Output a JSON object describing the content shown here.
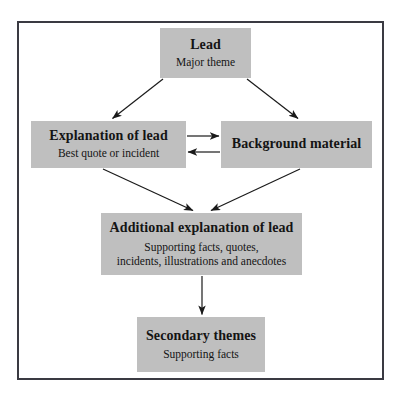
{
  "diagram": {
    "frame_color": "#3a3a42",
    "node_fill": "#bfbfbf",
    "text_color": "#141414",
    "arrow_color": "#1a1a1a",
    "nodes": [
      {
        "id": "lead",
        "title": "Lead",
        "subtitle": "Major theme"
      },
      {
        "id": "explanation",
        "title": "Explanation of lead",
        "subtitle": "Best quote or incident"
      },
      {
        "id": "background",
        "title": "Background material",
        "subtitle": ""
      },
      {
        "id": "additional",
        "title": "Additional explanation of lead",
        "subtitle_line1": "Supporting facts, quotes,",
        "subtitle_line2": "incidents, illustrations and anecdotes"
      },
      {
        "id": "secondary",
        "title": "Secondary themes",
        "subtitle": "Supporting facts"
      }
    ],
    "connectors": [
      {
        "id": "lead-to-explanation",
        "from": "lead",
        "to": "explanation",
        "direction": "down-left"
      },
      {
        "id": "lead-to-background",
        "from": "lead",
        "to": "background",
        "direction": "down-right"
      },
      {
        "id": "explanation-to-background",
        "from": "explanation",
        "to": "background",
        "direction": "right"
      },
      {
        "id": "background-to-explanation",
        "from": "background",
        "to": "explanation",
        "direction": "left"
      },
      {
        "id": "explanation-to-additional",
        "from": "explanation",
        "to": "additional",
        "direction": "down-right"
      },
      {
        "id": "background-to-additional",
        "from": "background",
        "to": "additional",
        "direction": "down-left"
      },
      {
        "id": "additional-to-secondary",
        "from": "additional",
        "to": "secondary",
        "direction": "down"
      }
    ]
  }
}
